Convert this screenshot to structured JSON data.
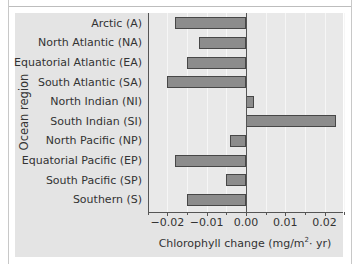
{
  "chart_data": {
    "type": "bar",
    "orientation": "horizontal",
    "title": "",
    "xlabel": "Chlorophyll change (mg/m²· yr)",
    "xlabel_parts": {
      "pre": "Chlorophyll change (mg/m",
      "sup": "2",
      "post": "· yr)"
    },
    "ylabel": "Ocean region",
    "xlim": [
      -0.025,
      0.025
    ],
    "xticks": [
      "-0.02",
      "-0.01",
      "0.00",
      "0.01",
      "0.02"
    ],
    "grid": true,
    "legend": null,
    "categories": [
      "Arctic (A)",
      "North Atlantic (NA)",
      "Equatorial Atlantic (EA)",
      "South Atlantic (SA)",
      "North Indian (NI)",
      "South Indian (SI)",
      "North Pacific (NP)",
      "Equatorial Pacific (EP)",
      "South Pacific (SP)",
      "Southern (S)"
    ],
    "values": [
      -0.018,
      -0.012,
      -0.015,
      -0.02,
      0.002,
      0.023,
      -0.004,
      -0.018,
      -0.005,
      -0.015
    ]
  },
  "colors": {
    "bar_fill": "#8c8c8c",
    "bar_border": "#474747",
    "panel_bg": "#e4e4e4",
    "plot_bg": "#e9e9e9"
  }
}
